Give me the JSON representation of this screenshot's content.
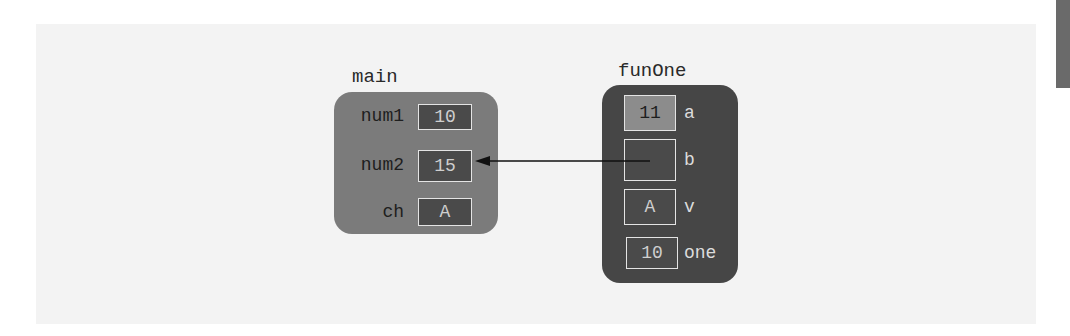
{
  "diagram": {
    "type": "memory-stack-frames",
    "frames": [
      {
        "name": "main",
        "color": "#7b7b7b",
        "variables": [
          {
            "label": "num1",
            "value": "10"
          },
          {
            "label": "num2",
            "value": "15"
          },
          {
            "label": "ch",
            "value": "A"
          }
        ]
      },
      {
        "name": "funOne",
        "color": "#464646",
        "variables": [
          {
            "label": "a",
            "value": "11",
            "highlighted": true
          },
          {
            "label": "b",
            "value": "",
            "reference_to": "main.num2"
          },
          {
            "label": "v",
            "value": "A"
          },
          {
            "label": "one",
            "value": "10"
          }
        ]
      }
    ],
    "arrows": [
      {
        "from": "funOne.b",
        "to": "main.num2"
      }
    ]
  }
}
